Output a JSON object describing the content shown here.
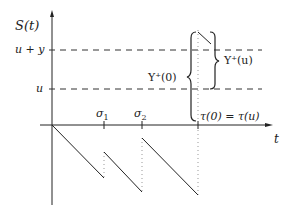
{
  "diagram": {
    "y_axis_label": "S(t)",
    "x_axis_label": "t",
    "levels": [
      {
        "label": "u + y",
        "name": "u-plus-y-level"
      },
      {
        "label": "u",
        "name": "u-level"
      }
    ],
    "time_marks": [
      "σ1",
      "σ2",
      "τ(0) = τ(u)"
    ],
    "sigma1_base": "σ",
    "sigma1_sub": "1",
    "sigma2_base": "σ",
    "sigma2_sub": "2",
    "tau_label": "τ(0) = τ(u)",
    "brace_left_label": "Y⁺(0)",
    "brace_right_label": "Y⁺(u)",
    "colors": {
      "line": "#222222",
      "dashed": "#333333",
      "dotted": "#999999"
    }
  }
}
